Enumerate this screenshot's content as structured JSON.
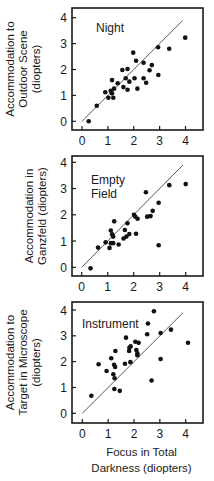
{
  "chart_data": [
    {
      "type": "scatter",
      "panel_label": "Night",
      "ylabel_lines": [
        "Accommodation to",
        "Outdoor Scene",
        "(diopters)"
      ],
      "xlabel_lines": [],
      "xlim": [
        0,
        4
      ],
      "ylim": [
        0,
        4
      ],
      "xticks": [
        0,
        1,
        2,
        3,
        4
      ],
      "yticks": [
        0,
        1,
        2,
        3,
        4
      ],
      "reference_line": {
        "from": [
          0,
          0
        ],
        "to": [
          4,
          4
        ],
        "label": "unity line"
      },
      "points": [
        [
          0.26,
          0.0
        ],
        [
          0.57,
          0.6
        ],
        [
          0.9,
          1.12
        ],
        [
          1.02,
          0.91
        ],
        [
          1.11,
          1.18
        ],
        [
          1.16,
          1.08
        ],
        [
          1.21,
          0.91
        ],
        [
          1.16,
          1.59
        ],
        [
          1.24,
          1.26
        ],
        [
          1.38,
          1.47
        ],
        [
          1.56,
          1.98
        ],
        [
          1.76,
          2.02
        ],
        [
          1.6,
          1.32
        ],
        [
          1.69,
          1.66
        ],
        [
          1.83,
          1.53
        ],
        [
          1.76,
          1.22
        ],
        [
          1.98,
          2.65
        ],
        [
          2.03,
          1.66
        ],
        [
          2.09,
          2.34
        ],
        [
          2.14,
          1.26
        ],
        [
          2.38,
          2.26
        ],
        [
          2.38,
          1.66
        ],
        [
          2.48,
          1.49
        ],
        [
          2.61,
          1.97
        ],
        [
          2.7,
          2.17
        ],
        [
          2.95,
          1.79
        ],
        [
          2.94,
          2.86
        ],
        [
          3.37,
          2.8
        ],
        [
          3.99,
          3.23
        ]
      ],
      "layout": {
        "frame": [
          72,
          8,
          203,
          130
        ],
        "x0": 82,
        "x4": 185.5,
        "y0": 121.3,
        "y4": 17.7,
        "label_pos": [
          96,
          32
        ],
        "ylabel_x": 27
      }
    },
    {
      "type": "scatter",
      "panel_label": "Empty Field",
      "panel_label_lines": [
        "Empty",
        "Field"
      ],
      "ylabel_lines": [
        "Accommodation in",
        "Ganzfeld (diopters)"
      ],
      "xlabel_lines": [],
      "xlim": [
        0,
        4
      ],
      "ylim": [
        0,
        4
      ],
      "xticks": [
        0,
        1,
        2,
        3,
        4
      ],
      "yticks": [
        0,
        1,
        2,
        3,
        4
      ],
      "reference_line": {
        "from": [
          0,
          0
        ],
        "to": [
          4,
          4
        ],
        "label": "unity line"
      },
      "points": [
        [
          0.34,
          -0.04
        ],
        [
          0.63,
          0.75
        ],
        [
          0.92,
          0.95
        ],
        [
          1.07,
          0.74
        ],
        [
          1.12,
          0.92
        ],
        [
          1.21,
          0.92
        ],
        [
          1.12,
          1.4
        ],
        [
          1.17,
          1.26
        ],
        [
          1.21,
          1.17
        ],
        [
          1.25,
          1.75
        ],
        [
          1.42,
          0.87
        ],
        [
          1.61,
          1.1
        ],
        [
          1.66,
          1.42
        ],
        [
          1.76,
          1.68
        ],
        [
          1.72,
          1.17
        ],
        [
          1.83,
          1.27
        ],
        [
          2.01,
          2.0
        ],
        [
          2.06,
          1.93
        ],
        [
          2.15,
          1.85
        ],
        [
          2.09,
          1.28
        ],
        [
          2.47,
          2.86
        ],
        [
          2.52,
          1.93
        ],
        [
          2.65,
          1.95
        ],
        [
          2.73,
          2.15
        ],
        [
          2.96,
          2.46
        ],
        [
          2.96,
          0.84
        ],
        [
          3.37,
          3.13
        ],
        [
          4.0,
          3.17
        ]
      ],
      "layout": {
        "frame": [
          72,
          156,
          203,
          276
        ],
        "x0": 81.7,
        "x4": 185.7,
        "y0": 267.3,
        "y4": 162.3,
        "label_pos": [
          91,
          184
        ],
        "ylabel_x": 33
      }
    },
    {
      "type": "scatter",
      "panel_label": "Instrument",
      "ylabel_lines": [
        "Accommodation to",
        "Target in Microscope",
        "(diopters)"
      ],
      "xlabel_lines": [
        "Focus in Total",
        "Darkness (diopters)"
      ],
      "xlim": [
        0,
        4
      ],
      "ylim": [
        0,
        4
      ],
      "xticks": [
        0,
        1,
        2,
        3,
        4
      ],
      "yticks": [
        0,
        1,
        2,
        3,
        4
      ],
      "reference_line": {
        "from": [
          0,
          0
        ],
        "to": [
          4,
          4
        ],
        "label": "unity line"
      },
      "points": [
        [
          0.35,
          0.68
        ],
        [
          0.63,
          1.9
        ],
        [
          0.94,
          1.64
        ],
        [
          1.12,
          2.13
        ],
        [
          1.2,
          1.51
        ],
        [
          1.25,
          1.36
        ],
        [
          1.23,
          1.88
        ],
        [
          1.27,
          1.79
        ],
        [
          1.28,
          2.41
        ],
        [
          1.24,
          0.94
        ],
        [
          1.45,
          0.87
        ],
        [
          1.65,
          1.92
        ],
        [
          1.69,
          2.93
        ],
        [
          1.81,
          2.41
        ],
        [
          1.82,
          2.54
        ],
        [
          1.87,
          2.59
        ],
        [
          1.86,
          1.98
        ],
        [
          2.05,
          2.77
        ],
        [
          2.09,
          2.45
        ],
        [
          2.13,
          2.32
        ],
        [
          2.18,
          2.73
        ],
        [
          2.13,
          2.25
        ],
        [
          2.51,
          3.06
        ],
        [
          2.54,
          3.48
        ],
        [
          2.77,
          3.95
        ],
        [
          2.68,
          1.27
        ],
        [
          3.03,
          3.11
        ],
        [
          3.03,
          2.1
        ],
        [
          3.43,
          3.24
        ],
        [
          4.09,
          2.73
        ]
      ],
      "layout": {
        "frame": [
          72,
          302,
          203,
          423
        ],
        "x0": 82.3,
        "x4": 185.7,
        "y0": 413.3,
        "y4": 310,
        "label_pos": [
          82,
          328
        ],
        "ylabel_x": 27
      }
    }
  ]
}
